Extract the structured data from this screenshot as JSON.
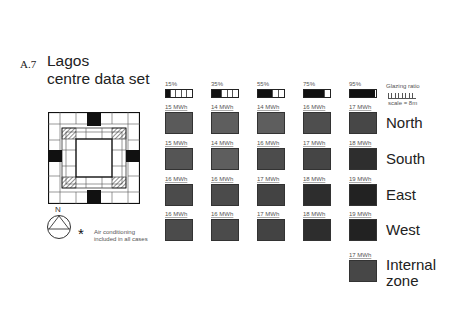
{
  "figure": {
    "number": "A.7",
    "title_line1": "Lagos",
    "title_line2": "centre data set"
  },
  "compass": {
    "north_label": "N"
  },
  "note": {
    "symbol": "*",
    "line1": "Air conditioning",
    "line2": "included in all cases"
  },
  "legend": {
    "glazing_ratio_label": "Glazing ratio",
    "scale_label": "scale = 8m"
  },
  "glazing_columns": [
    {
      "label": "15%",
      "fill_pct": 15
    },
    {
      "label": "35%",
      "fill_pct": 35
    },
    {
      "label": "55%",
      "fill_pct": 55
    },
    {
      "label": "75%",
      "fill_pct": 75
    },
    {
      "label": "95%",
      "fill_pct": 95
    }
  ],
  "rows": [
    {
      "name": "North",
      "values": [
        "15 MWh",
        "14 MWh",
        "14 MWh",
        "16 MWh",
        "17 MWh"
      ],
      "shades": [
        "#5a5a5a",
        "#5e5e5e",
        "#5e5e5e",
        "#4e4e4e",
        "#474747"
      ]
    },
    {
      "name": "South",
      "values": [
        "15 MWh",
        "14 MWh",
        "16 MWh",
        "17 MWh",
        "18 MWh"
      ],
      "shades": [
        "#555555",
        "#5e5e5e",
        "#4c4c4c",
        "#454545",
        "#2e2e2e"
      ]
    },
    {
      "name": "East",
      "values": [
        "16 MWh",
        "16 MWh",
        "17 MWh",
        "18 MWh",
        "19 MWh"
      ],
      "shades": [
        "#4b4b4b",
        "#4b4b4b",
        "#434343",
        "#2d2d2d",
        "#222222"
      ]
    },
    {
      "name": "West",
      "values": [
        "16 MWh",
        "16 MWh",
        "17 MWh",
        "18 MWh",
        "19 MWh"
      ],
      "shades": [
        "#4b4b4b",
        "#4b4b4b",
        "#434343",
        "#2d2d2d",
        "#222222"
      ]
    }
  ],
  "internal_zone": {
    "value": "17 MWh",
    "label_line1": "Internal",
    "label_line2": "zone",
    "shade": "#474747"
  }
}
